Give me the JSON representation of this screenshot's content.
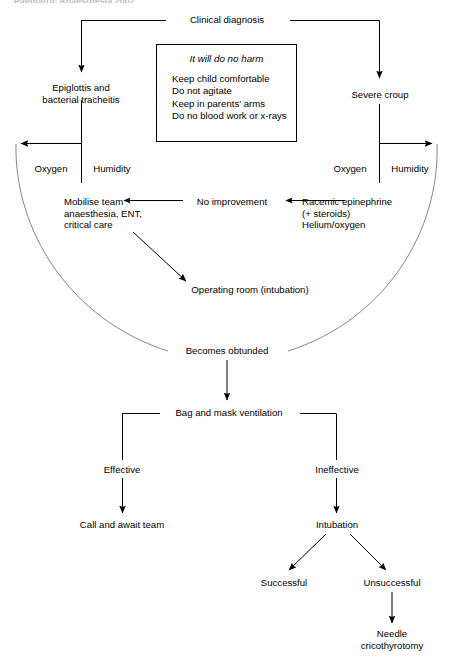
{
  "page": {
    "header_clipped": "Paediatric Anaesthesia 2002",
    "background_color": "#ffffff",
    "line_color": "#000000",
    "arc_color": "#6b6b6b",
    "width": 453,
    "height": 663
  },
  "diagram": {
    "type": "flowchart",
    "title": "Clinical diagnosis",
    "nodes": [
      {
        "id": "clinical-diagnosis",
        "label": "Clinical diagnosis",
        "x": 227,
        "y": 14
      },
      {
        "id": "epiglottis",
        "label": "Epiglottis and\nbacterial tracheitis",
        "x": 81,
        "y": 86
      },
      {
        "id": "severe-croup",
        "label": "Severe croup",
        "x": 380,
        "y": 92
      },
      {
        "id": "oxygen-left",
        "label": "Oxygen",
        "x": 51,
        "y": 167
      },
      {
        "id": "humidity-left",
        "label": "Humidity",
        "x": 112,
        "y": 167
      },
      {
        "id": "oxygen-right",
        "label": "Oxygen",
        "x": 350,
        "y": 167
      },
      {
        "id": "humidity-right",
        "label": "Humidity",
        "x": 410,
        "y": 167
      },
      {
        "id": "mobilise-team",
        "label": "Mobilise team\nanaesthesia, ENT,\ncritical care",
        "x": 64,
        "y": 201
      },
      {
        "id": "no-improvement",
        "label": "No improvement",
        "x": 232,
        "y": 202
      },
      {
        "id": "racemic-epinephrine",
        "label": "Racemic epinephrine\n(+ steroids)\nHelium/oxygen",
        "x": 302,
        "y": 201
      },
      {
        "id": "operating-room",
        "label": "Operating room (intubation)",
        "x": 250,
        "y": 288
      },
      {
        "id": "becomes-obtunded",
        "label": "Becomes obtunded",
        "x": 227,
        "y": 348
      },
      {
        "id": "bag-mask-ventilation",
        "label": "Bag and mask ventilation",
        "x": 229,
        "y": 408
      },
      {
        "id": "effective",
        "label": "Effective",
        "x": 122,
        "y": 469
      },
      {
        "id": "ineffective",
        "label": "Ineffective",
        "x": 337,
        "y": 469
      },
      {
        "id": "call-and-await-team",
        "label": "Call and await team",
        "x": 122,
        "y": 524
      },
      {
        "id": "intubation",
        "label": "Intubation",
        "x": 337,
        "y": 524
      },
      {
        "id": "successful",
        "label": "Successful",
        "x": 284,
        "y": 582
      },
      {
        "id": "unsuccessful",
        "label": "Unsuccessful",
        "x": 392,
        "y": 582
      },
      {
        "id": "needle-cricothyrotomy",
        "label": "Needle\ncricothyrotomy",
        "x": 392,
        "y": 634
      }
    ],
    "advice_box": {
      "title": "It will do no harm",
      "items": [
        "Keep child comfortable",
        "Do not agitate",
        "Keep in parents' arms",
        "Do no blood work or x-rays"
      ]
    },
    "edges": [
      {
        "from": "clinical-diagnosis",
        "to": "epiglottis"
      },
      {
        "from": "clinical-diagnosis",
        "to": "severe-croup"
      },
      {
        "from": "epiglottis",
        "to": "oxygen-left"
      },
      {
        "from": "severe-croup",
        "to": "humidity-right"
      },
      {
        "from": "racemic-epinephrine",
        "to": "no-improvement"
      },
      {
        "from": "no-improvement",
        "to": "mobilise-team"
      },
      {
        "from": "mobilise-team",
        "to": "operating-room"
      },
      {
        "from": "oxygen-left",
        "to": "becomes-obtunded"
      },
      {
        "from": "humidity-right",
        "to": "becomes-obtunded"
      },
      {
        "from": "becomes-obtunded",
        "to": "bag-mask-ventilation"
      },
      {
        "from": "bag-mask-ventilation",
        "to": "effective"
      },
      {
        "from": "bag-mask-ventilation",
        "to": "ineffective"
      },
      {
        "from": "effective",
        "to": "call-and-await-team"
      },
      {
        "from": "ineffective",
        "to": "intubation"
      },
      {
        "from": "intubation",
        "to": "successful"
      },
      {
        "from": "intubation",
        "to": "unsuccessful"
      },
      {
        "from": "unsuccessful",
        "to": "needle-cricothyrotomy"
      }
    ]
  }
}
